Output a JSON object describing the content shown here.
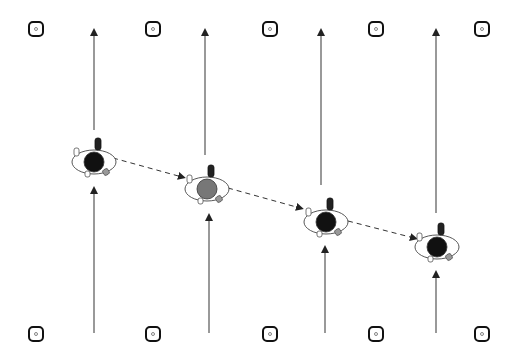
{
  "diagram": {
    "type": "sports-drill",
    "background": "#ffffff",
    "line_color": "#555555",
    "cones_top": [
      {
        "x": 36,
        "y": 29
      },
      {
        "x": 153,
        "y": 29
      },
      {
        "x": 270,
        "y": 29
      },
      {
        "x": 376,
        "y": 29
      },
      {
        "x": 482,
        "y": 29
      }
    ],
    "cones_bottom": [
      {
        "x": 36,
        "y": 334
      },
      {
        "x": 153,
        "y": 334
      },
      {
        "x": 270,
        "y": 334
      },
      {
        "x": 376,
        "y": 334
      },
      {
        "x": 482,
        "y": 334
      }
    ],
    "arrows_upper": [
      {
        "x": 94,
        "y1": 130,
        "y2": 28
      },
      {
        "x": 205,
        "y1": 155,
        "y2": 28
      },
      {
        "x": 321,
        "y1": 185,
        "y2": 28
      },
      {
        "x": 436,
        "y1": 213,
        "y2": 28
      }
    ],
    "arrows_lower": [
      {
        "x": 94,
        "y1": 333,
        "y2": 186
      },
      {
        "x": 209,
        "y1": 333,
        "y2": 213
      },
      {
        "x": 325,
        "y1": 333,
        "y2": 245
      },
      {
        "x": 436,
        "y1": 333,
        "y2": 270
      }
    ],
    "players": [
      {
        "x": 94,
        "y": 160,
        "body": "#111111"
      },
      {
        "x": 207,
        "y": 187,
        "body": "#777777"
      },
      {
        "x": 326,
        "y": 220,
        "body": "#111111"
      },
      {
        "x": 437,
        "y": 245,
        "body": "#111111"
      }
    ],
    "dashed_path": [
      {
        "x1": 113,
        "y1": 158,
        "x2": 182,
        "y2": 177
      },
      {
        "x1": 228,
        "y1": 188,
        "x2": 300,
        "y2": 208
      },
      {
        "x1": 348,
        "y1": 221,
        "x2": 414,
        "y2": 238
      }
    ]
  }
}
